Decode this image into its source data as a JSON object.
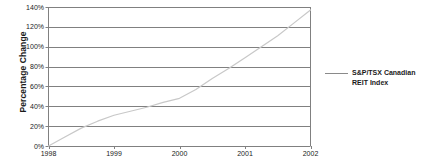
{
  "chart_data": {
    "type": "line",
    "title": "",
    "xlabel": "",
    "ylabel": "Percentage Change",
    "xlim": [
      1998,
      2002
    ],
    "ylim": [
      0,
      140
    ],
    "grid": true,
    "legend_position": "right",
    "x_ticks": [
      "1998",
      "1999",
      "2000",
      "2001",
      "2002"
    ],
    "y_ticks": [
      "0%",
      "20%",
      "40%",
      "60%",
      "80%",
      "100%",
      "120%",
      "140%"
    ],
    "y_tick_values": [
      0,
      20,
      40,
      60,
      80,
      100,
      120,
      140
    ],
    "series": [
      {
        "name": "S&P/TSX Canadian REIT Index",
        "color": "#c8c8c8",
        "x": [
          1998.0,
          1998.25,
          1998.5,
          1998.75,
          1999.0,
          1999.25,
          1999.5,
          1999.75,
          2000.0,
          2000.25,
          2000.5,
          2000.75,
          2001.0,
          2001.25,
          2001.5,
          2001.75,
          2002.0
        ],
        "values": [
          0,
          9,
          18,
          25,
          31,
          35,
          39,
          44,
          48,
          57,
          68,
          78,
          89,
          100,
          111,
          124,
          137
        ]
      }
    ]
  },
  "legend": {
    "entries": [
      {
        "label": "S&P/TSX Canadian REIT Index",
        "color": "#8a8a8a"
      }
    ]
  },
  "axis": {
    "y_title": "Percentage Change"
  },
  "colors": {
    "line": "#c8c8c8",
    "grid": "#808080",
    "axis": "#808080",
    "text": "#1a1a1a",
    "background": "#ffffff"
  }
}
